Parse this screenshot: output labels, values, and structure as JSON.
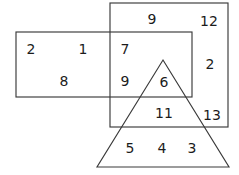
{
  "diagram": {
    "type": "overlapping-shapes-number-diagram",
    "background_color": "#ffffff",
    "stroke_color": "#3a3a3a",
    "text_color": "#1c1c1c",
    "shapes": {
      "left_rectangle": {
        "name": "left-rectangle",
        "x": 16,
        "y": 32,
        "width": 176,
        "height": 65
      },
      "big_rectangle": {
        "name": "big-rectangle",
        "x": 110,
        "y": 3,
        "width": 118,
        "height": 124
      },
      "triangle": {
        "name": "triangle",
        "apex_x": 163,
        "apex_y": 60,
        "left_x": 97,
        "left_y": 167,
        "right_x": 229,
        "right_y": 167
      }
    },
    "numbers": [
      {
        "id": "n-9-top",
        "value": "9",
        "x": 152,
        "y": 19
      },
      {
        "id": "n-12",
        "value": "12",
        "x": 209,
        "y": 21
      },
      {
        "id": "n-2-left",
        "value": "2",
        "x": 31,
        "y": 49
      },
      {
        "id": "n-1",
        "value": "1",
        "x": 83,
        "y": 49
      },
      {
        "id": "n-7",
        "value": "7",
        "x": 125,
        "y": 49
      },
      {
        "id": "n-2-right",
        "value": "2",
        "x": 210,
        "y": 64
      },
      {
        "id": "n-8",
        "value": "8",
        "x": 64,
        "y": 81
      },
      {
        "id": "n-9-mid",
        "value": "9",
        "x": 125,
        "y": 81
      },
      {
        "id": "n-6",
        "value": "6",
        "x": 164,
        "y": 82
      },
      {
        "id": "n-11",
        "value": "11",
        "x": 164,
        "y": 113
      },
      {
        "id": "n-13",
        "value": "13",
        "x": 212,
        "y": 115
      },
      {
        "id": "n-5",
        "value": "5",
        "x": 130,
        "y": 148
      },
      {
        "id": "n-4",
        "value": "4",
        "x": 162,
        "y": 148
      },
      {
        "id": "n-3",
        "value": "3",
        "x": 192,
        "y": 148
      }
    ]
  }
}
